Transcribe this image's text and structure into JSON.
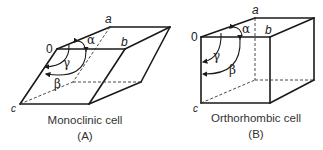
{
  "figure": {
    "panels": [
      {
        "id": "A",
        "caption": "Monoclinic cell",
        "panel_label": "(A)",
        "vertex_labels": {
          "origin": "0",
          "a": "a",
          "b": "b",
          "c": "c"
        },
        "angle_labels": {
          "alpha": "α",
          "beta": "β",
          "gamma": "γ"
        }
      },
      {
        "id": "B",
        "caption": "Orthorhombic cell",
        "panel_label": "(B)",
        "vertex_labels": {
          "origin": "0",
          "a": "a",
          "b": "b",
          "c": "c"
        },
        "angle_labels": {
          "alpha": "α",
          "beta": "β",
          "gamma": "γ"
        }
      }
    ]
  }
}
